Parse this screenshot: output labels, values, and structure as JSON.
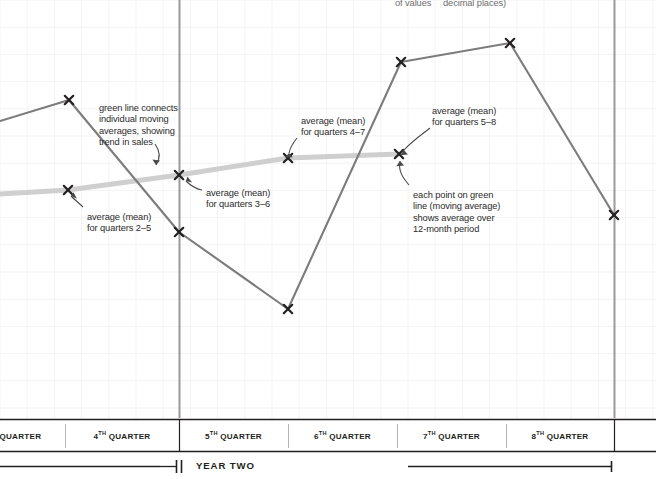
{
  "figure": {
    "title_clipped_top": [
      {
        "text": "of values",
        "x": 395,
        "y": -2
      },
      {
        "text": "decimal places)",
        "x": 443,
        "y": -2
      }
    ]
  },
  "axis": {
    "quarters": [
      {
        "ordinal": "3",
        "suffix": "RD",
        "label": "QUARTER",
        "full": "3RD QUARTER"
      },
      {
        "ordinal": "4",
        "suffix": "TH",
        "label": "QUARTER",
        "full": "4TH QUARTER"
      },
      {
        "ordinal": "5",
        "suffix": "TH",
        "label": "QUARTER",
        "full": "5TH QUARTER"
      },
      {
        "ordinal": "6",
        "suffix": "TH",
        "label": "QUARTER",
        "full": "6TH QUARTER"
      },
      {
        "ordinal": "7",
        "suffix": "TH",
        "label": "QUARTER",
        "full": "7TH QUARTER"
      },
      {
        "ordinal": "8",
        "suffix": "TH",
        "label": "QUARTER",
        "full": "8TH QUARTER"
      }
    ],
    "period_label": "YEAR TWO"
  },
  "annotations": [
    {
      "name": "green-line-connects",
      "lines": [
        "green line connects",
        "individual moving",
        "averages, showing",
        "trend in sales"
      ],
      "x": 99,
      "y": 103
    },
    {
      "name": "average-quarters-2-5",
      "lines": [
        "average (mean)",
        "for quarters 2–5"
      ],
      "x": 87,
      "y": 212
    },
    {
      "name": "average-quarters-3-6",
      "lines": [
        "average (mean)",
        "for quarters 3–6"
      ],
      "x": 206,
      "y": 188
    },
    {
      "name": "average-quarters-4-7",
      "lines": [
        "average (mean)",
        "for quarters 4–7"
      ],
      "x": 301,
      "y": 116
    },
    {
      "name": "average-quarters-5-8",
      "lines": [
        "average (mean)",
        "for quarters 5–8"
      ],
      "x": 432,
      "y": 106
    },
    {
      "name": "each-point-moving-average",
      "lines": [
        "each point on green",
        "line (moving average)",
        "shows average over",
        "12-month period"
      ],
      "x": 413,
      "y": 190
    }
  ],
  "colors": {
    "sales_line": "#7c7c7c",
    "moving_average_line": "#cfcfcf",
    "divider": "#9a9a9a",
    "grid": "#f2f2f2",
    "marker": "#231f20",
    "axis_rule": "#231f20",
    "text": "#2b2b2b"
  },
  "chart_data": {
    "type": "line",
    "title": "",
    "xlabel": "",
    "ylabel": "",
    "grid": true,
    "legend_position": "none",
    "categories": [
      "3RD QUARTER",
      "4TH QUARTER",
      "5TH QUARTER",
      "6TH QUARTER",
      "7TH QUARTER",
      "8TH QUARTER"
    ],
    "xlim": [
      0,
      656
    ],
    "ylim": [
      0,
      418
    ],
    "series": [
      {
        "name": "sales",
        "style": "solid",
        "color": "#7c7c7c",
        "markers": "x",
        "points": [
          {
            "x": 0,
            "y": 121,
            "clipped": true
          },
          {
            "x": 69,
            "y": 100
          },
          {
            "x": 179,
            "y": 232
          },
          {
            "x": 288,
            "y": 309
          },
          {
            "x": 401,
            "y": 62
          },
          {
            "x": 510,
            "y": 43
          },
          {
            "x": 614,
            "y": 215
          }
        ]
      },
      {
        "name": "moving average (12-month)",
        "style": "solid",
        "color": "#cfcfcf",
        "markers": "x",
        "points": [
          {
            "x": 0,
            "y": 194,
            "clipped": true
          },
          {
            "x": 68,
            "y": 190
          },
          {
            "x": 179,
            "y": 175
          },
          {
            "x": 288,
            "y": 158
          },
          {
            "x": 399,
            "y": 154
          }
        ]
      }
    ]
  }
}
